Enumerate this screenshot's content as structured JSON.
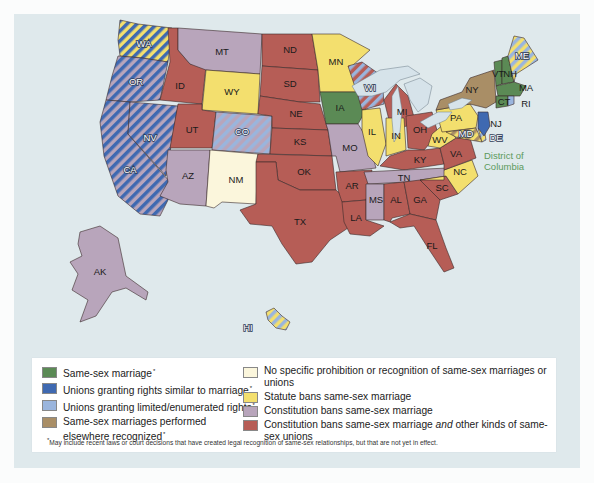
{
  "colors": {
    "background_panel": "#dfe9ec",
    "same_sex_marriage": "#5b8a55",
    "unions_similar": "#3f69b1",
    "unions_limited": "#9ab5dd",
    "recognized_elsewhere": "#a98e66",
    "no_prohibition": "#fbf6dc",
    "statute_ban": "#f3df6e",
    "constitution_ban": "#b8a5bb",
    "constitution_ban_plus": "#b65d56",
    "dc_label": "#5c9a5c"
  },
  "legend": {
    "left": [
      {
        "key": "same_sex_marriage",
        "label": "Same-sex marriage",
        "asterisk": "*"
      },
      {
        "key": "unions_similar",
        "label": "Unions granting rights similar to marriage",
        "asterisk": "*"
      },
      {
        "key": "unions_limited",
        "label": "Unions granting limited/enumerated rights",
        "asterisk": "*"
      },
      {
        "key": "recognized_elsewhere",
        "label": "Same-sex marriages performed elsewhere recognized",
        "asterisk": "*"
      }
    ],
    "right": [
      {
        "key": "no_prohibition",
        "label": "No specific prohibition or recognition of same-sex marriages or unions"
      },
      {
        "key": "statute_ban",
        "label": "Statute bans same-sex marriage"
      },
      {
        "key": "constitution_ban",
        "label": "Constitution bans same-sex marriage"
      },
      {
        "key": "constitution_ban_plus",
        "label_pre": "Constitution bans same-sex marriage ",
        "label_em": "and",
        "label_post": " other kinds of same-sex unions"
      }
    ],
    "footnote": "May include recent laws or court decisions that have created legal recognition of same-sex relationships, but that are not yet in effect.",
    "footnote_mark": "*"
  },
  "map": {
    "dc_label_line1": "District of",
    "dc_label_line2": "Columbia",
    "states": [
      {
        "abbr": "WA",
        "category": "statute_ban",
        "stripe": "unions_similar"
      },
      {
        "abbr": "OR",
        "category": "constitution_ban",
        "stripe": "unions_similar"
      },
      {
        "abbr": "CA",
        "category": "constitution_ban",
        "stripe": "unions_similar"
      },
      {
        "abbr": "NV",
        "category": "constitution_ban",
        "stripe": "unions_similar"
      },
      {
        "abbr": "ID",
        "category": "constitution_ban_plus"
      },
      {
        "abbr": "MT",
        "category": "constitution_ban"
      },
      {
        "abbr": "WY",
        "category": "statute_ban"
      },
      {
        "abbr": "UT",
        "category": "constitution_ban_plus"
      },
      {
        "abbr": "CO",
        "category": "constitution_ban",
        "stripe": "unions_limited"
      },
      {
        "abbr": "AZ",
        "category": "constitution_ban"
      },
      {
        "abbr": "NM",
        "category": "no_prohibition"
      },
      {
        "abbr": "ND",
        "category": "constitution_ban_plus"
      },
      {
        "abbr": "SD",
        "category": "constitution_ban_plus"
      },
      {
        "abbr": "NE",
        "category": "constitution_ban_plus"
      },
      {
        "abbr": "KS",
        "category": "constitution_ban_plus"
      },
      {
        "abbr": "OK",
        "category": "constitution_ban_plus"
      },
      {
        "abbr": "TX",
        "category": "constitution_ban_plus"
      },
      {
        "abbr": "MN",
        "category": "statute_ban"
      },
      {
        "abbr": "IA",
        "category": "same_sex_marriage"
      },
      {
        "abbr": "MO",
        "category": "constitution_ban"
      },
      {
        "abbr": "AR",
        "category": "constitution_ban_plus"
      },
      {
        "abbr": "LA",
        "category": "constitution_ban_plus"
      },
      {
        "abbr": "WI",
        "category": "constitution_ban_plus",
        "stripe": "unions_limited"
      },
      {
        "abbr": "IL",
        "category": "statute_ban"
      },
      {
        "abbr": "MI",
        "category": "constitution_ban_plus"
      },
      {
        "abbr": "IN",
        "category": "statute_ban"
      },
      {
        "abbr": "OH",
        "category": "constitution_ban_plus"
      },
      {
        "abbr": "KY",
        "category": "constitution_ban_plus"
      },
      {
        "abbr": "TN",
        "category": "constitution_ban"
      },
      {
        "abbr": "MS",
        "category": "constitution_ban"
      },
      {
        "abbr": "AL",
        "category": "constitution_ban_plus"
      },
      {
        "abbr": "GA",
        "category": "constitution_ban_plus"
      },
      {
        "abbr": "FL",
        "category": "constitution_ban_plus"
      },
      {
        "abbr": "SC",
        "category": "constitution_ban_plus"
      },
      {
        "abbr": "NC",
        "category": "statute_ban"
      },
      {
        "abbr": "VA",
        "category": "constitution_ban_plus"
      },
      {
        "abbr": "WV",
        "category": "statute_ban"
      },
      {
        "abbr": "PA",
        "category": "statute_ban"
      },
      {
        "abbr": "MD",
        "category": "statute_ban",
        "stripe": "recognized_elsewhere"
      },
      {
        "abbr": "DE",
        "category": "statute_ban",
        "stripe": "unions_limited"
      },
      {
        "abbr": "NJ",
        "category": "unions_similar"
      },
      {
        "abbr": "NY",
        "category": "recognized_elsewhere"
      },
      {
        "abbr": "VT",
        "category": "same_sex_marriage"
      },
      {
        "abbr": "NH",
        "category": "same_sex_marriage"
      },
      {
        "abbr": "MA",
        "category": "same_sex_marriage"
      },
      {
        "abbr": "CT",
        "category": "same_sex_marriage"
      },
      {
        "abbr": "RI",
        "category": "unions_limited"
      },
      {
        "abbr": "ME",
        "category": "statute_ban",
        "stripe": "unions_limited"
      },
      {
        "abbr": "AK",
        "category": "constitution_ban"
      },
      {
        "abbr": "HI",
        "category": "statute_ban",
        "stripe": "unions_limited"
      }
    ]
  }
}
